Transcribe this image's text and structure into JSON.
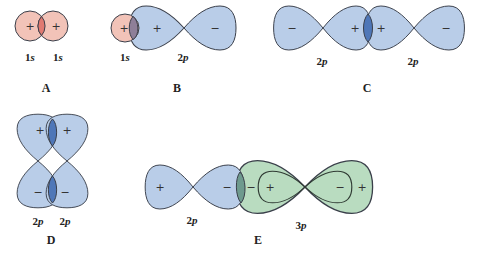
{
  "colors": {
    "s_fill": "#f2c3b8",
    "s_overlap": "#e07a72",
    "p_fill": "#b9cde8",
    "p_overlap": "#4f77b8",
    "mixed_overlap": "#8e7f98",
    "p3_fill": "#b9dcc0",
    "p_green_overlap": "#6e9a8e",
    "stroke": "#3a3f4a"
  },
  "panels": {
    "A": {
      "caption": "A",
      "orbitals": [
        "1s",
        "1s"
      ],
      "signs": [
        "+",
        "+"
      ]
    },
    "B": {
      "caption": "B",
      "orbitals": [
        "1s",
        "2p"
      ],
      "signs": [
        "+",
        "+",
        "−"
      ]
    },
    "C": {
      "caption": "C",
      "orbitals": [
        "2p",
        "2p"
      ],
      "signs": [
        "−",
        "+",
        "+",
        "−"
      ]
    },
    "D": {
      "caption": "D",
      "orbitals": [
        "2p",
        "2p"
      ],
      "signs": [
        "+",
        "+",
        "−",
        "−"
      ]
    },
    "E": {
      "caption": "E",
      "orbitals": [
        "2p",
        "3p"
      ],
      "signs": [
        "+",
        "−",
        "−",
        "+",
        "−",
        "+"
      ]
    }
  }
}
